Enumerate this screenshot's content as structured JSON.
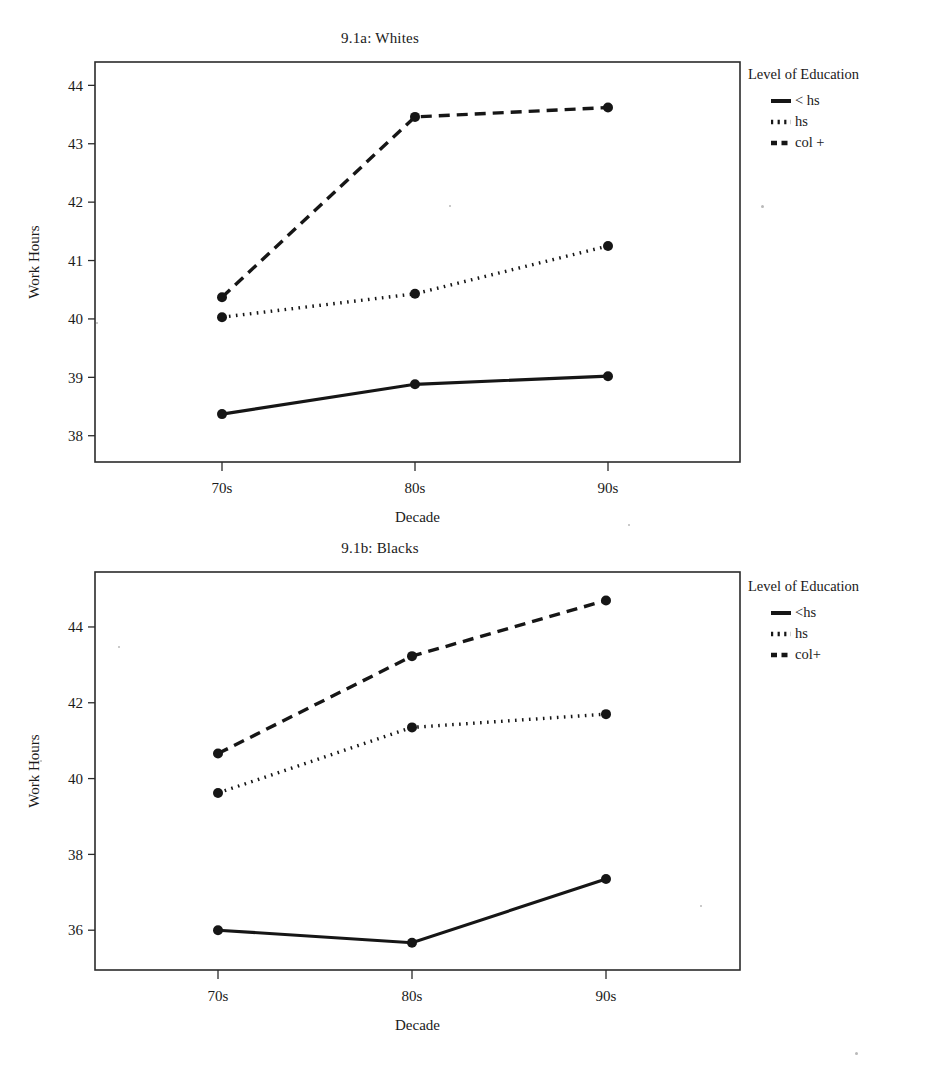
{
  "figure": {
    "panels": [
      {
        "id": "a",
        "title": "9.1a: Whites",
        "xlabel": "Decade",
        "ylabel": "Work Hours",
        "legend_title": "Level of Education"
      },
      {
        "id": "b",
        "title": "9.1b: Blacks",
        "xlabel": "Decade",
        "ylabel": "Work Hours",
        "legend_title": "Level of Education"
      }
    ]
  },
  "chart_data": [
    {
      "type": "line",
      "title": "9.1a: Whites",
      "xlabel": "Decade",
      "ylabel": "Work Hours",
      "categories": [
        "70s",
        "80s",
        "90s"
      ],
      "xtick_labels": [
        "70s",
        "80s",
        "90s"
      ],
      "ytick_labels": [
        "38",
        "39",
        "40",
        "41",
        "42",
        "43",
        "44"
      ],
      "yticks": [
        38,
        39,
        40,
        41,
        42,
        43,
        44
      ],
      "ylim": [
        37.55,
        44.4
      ],
      "grid": false,
      "legend_title": "Level of Education",
      "legend_position": "right",
      "series": [
        {
          "name": "< hs",
          "style": "solid",
          "values": [
            38.37,
            38.88,
            39.02
          ]
        },
        {
          "name": "hs",
          "style": "dotted",
          "values": [
            40.03,
            40.43,
            41.25
          ]
        },
        {
          "name": "col +",
          "style": "dashed",
          "values": [
            40.37,
            43.46,
            43.62
          ]
        }
      ]
    },
    {
      "type": "line",
      "title": "9.1b: Blacks",
      "xlabel": "Decade",
      "ylabel": "Work Hours",
      "categories": [
        "70s",
        "80s",
        "90s"
      ],
      "xtick_labels": [
        "70s",
        "80s",
        "90s"
      ],
      "ytick_labels": [
        "36",
        "38",
        "40",
        "42",
        "44"
      ],
      "yticks": [
        36,
        38,
        40,
        42,
        44
      ],
      "ylim": [
        34.95,
        45.45
      ],
      "grid": false,
      "legend_title": "Level of Education",
      "legend_position": "right",
      "series": [
        {
          "name": "<hs",
          "style": "solid",
          "values": [
            36.0,
            35.67,
            37.35
          ]
        },
        {
          "name": "hs",
          "style": "dotted",
          "values": [
            39.62,
            41.35,
            41.7
          ]
        },
        {
          "name": "col+",
          "style": "dashed",
          "values": [
            40.66,
            43.23,
            44.7
          ]
        }
      ]
    }
  ],
  "style": {
    "ink": "#161616",
    "frame": "#2b2b2b",
    "background": "#ffffff"
  }
}
